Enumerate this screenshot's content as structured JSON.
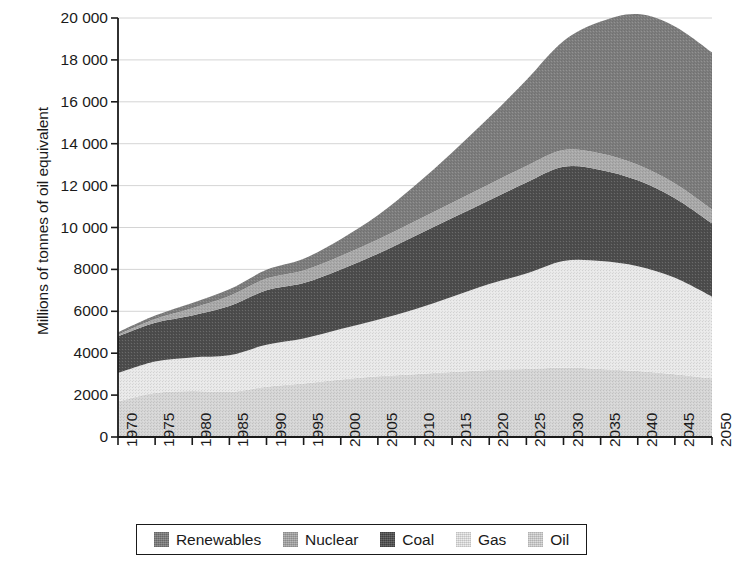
{
  "chart_data": {
    "type": "area",
    "stacked": true,
    "title": "",
    "subtitle": "",
    "xlabel": "",
    "ylabel": "Millions of tonnes of oil equivalent",
    "xlim": [
      1970,
      2050
    ],
    "ylim": [
      0,
      20000
    ],
    "ytick_step": 2000,
    "xtick_step": 5,
    "grid": true,
    "grid_axis": "y",
    "legend_position": "bottom",
    "stack_order_bottom_to_top": [
      "Oil",
      "Gas",
      "Coal",
      "Nuclear",
      "Renewables"
    ],
    "ytick_labels": [
      "0",
      "2000",
      "4000",
      "6000",
      "8000",
      "10 000",
      "12 000",
      "14 000",
      "16 000",
      "18 000",
      "20 000"
    ],
    "ytick_values": [
      0,
      2000,
      4000,
      6000,
      8000,
      10000,
      12000,
      14000,
      16000,
      18000,
      20000
    ],
    "xtick_labels": [
      "1970",
      "1975",
      "1980",
      "1985",
      "1990",
      "1995",
      "2000",
      "2005",
      "2010",
      "2015",
      "2020",
      "2025",
      "2030",
      "2035",
      "2040",
      "2045",
      "2050"
    ],
    "x": [
      1970,
      1975,
      1980,
      1985,
      1990,
      1995,
      2000,
      2005,
      2010,
      2015,
      2020,
      2025,
      2030,
      2035,
      2040,
      2045,
      2050
    ],
    "series": [
      {
        "name": "Oil",
        "color": "#d6d6d6",
        "values": [
          1700,
          2100,
          2200,
          2150,
          2400,
          2550,
          2750,
          2900,
          3000,
          3100,
          3200,
          3250,
          3300,
          3250,
          3150,
          3000,
          2800
        ]
      },
      {
        "name": "Gas",
        "color": "#e9e9e9",
        "values": [
          1350,
          1500,
          1600,
          1750,
          2000,
          2150,
          2400,
          2700,
          3100,
          3600,
          4100,
          4550,
          5100,
          5150,
          5000,
          4600,
          3900
        ]
      },
      {
        "name": "Coal",
        "color": "#4d4d4d",
        "values": [
          1750,
          1850,
          2000,
          2350,
          2600,
          2650,
          2850,
          3150,
          3500,
          3750,
          4000,
          4350,
          4500,
          4350,
          4100,
          3800,
          3500
        ]
      },
      {
        "name": "Nuclear",
        "color": "#a9a9a9",
        "values": [
          80,
          180,
          350,
          480,
          560,
          600,
          640,
          680,
          700,
          730,
          760,
          790,
          800,
          780,
          740,
          700,
          660
        ]
      },
      {
        "name": "Renewables",
        "color": "#7d7d7d",
        "values": [
          120,
          170,
          250,
          320,
          420,
          560,
          800,
          1150,
          1700,
          2400,
          3200,
          4100,
          5200,
          6300,
          7200,
          7500,
          7500
        ]
      }
    ],
    "totals": [
      5000,
      5800,
      6400,
      7050,
      7980,
      8510,
      9440,
      10580,
      12000,
      13580,
      15260,
      17040,
      18900,
      19830,
      20190,
      19600,
      18360
    ]
  },
  "legend": {
    "items": [
      {
        "label": "Renewables",
        "color": "#7d7d7d"
      },
      {
        "label": "Nuclear",
        "color": "#a9a9a9"
      },
      {
        "label": "Coal",
        "color": "#4d4d4d"
      },
      {
        "label": "Gas",
        "color": "#e9e9e9"
      },
      {
        "label": "Oil",
        "color": "#d6d6d6"
      }
    ]
  },
  "axes": {
    "y_axis_title": "Millions of tonnes of oil equivalent"
  },
  "colors": {
    "axis": "#1a1a1a",
    "grid": "#c9c9c9",
    "background": "#ffffff"
  }
}
